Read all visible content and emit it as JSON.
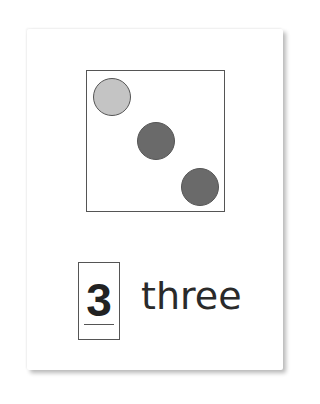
{
  "card": {
    "numeral": "3",
    "word": "three",
    "dots": [
      {
        "cx": 112,
        "cy": 97,
        "r": 19,
        "color": "#c4c4c4"
      },
      {
        "cx": 156,
        "cy": 141,
        "r": 19,
        "color": "#6a6a6a"
      },
      {
        "cx": 200,
        "cy": 187,
        "r": 19,
        "color": "#6a6a6a"
      }
    ]
  }
}
